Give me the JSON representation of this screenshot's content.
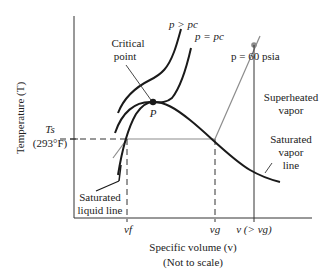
{
  "diagram": {
    "axes": {
      "y_label": "Temperature (T)",
      "x_label": "Specific volume (v)",
      "x_note": "(Not to scale)"
    },
    "labels": {
      "critical_point": [
        "Critical",
        "point"
      ],
      "point_p": "P",
      "p_gt_pc": "p > pc",
      "p_eq_pc": "p = pc",
      "p_60": "p = 60 psia",
      "superheated": [
        "Superheated",
        "vapor"
      ],
      "sat_vapor": [
        "Saturated",
        "vapor",
        "line"
      ],
      "sat_liquid": [
        "Saturated",
        "liquid line"
      ],
      "ts": "Ts",
      "ts_value": "(293°F)",
      "vf": "vf",
      "vg": "vg",
      "v_gt_vg": "v (> vg)"
    },
    "colors": {
      "curve": "#1a1a1a",
      "isobar_gray": "#8c8c8c",
      "axis": "#333333"
    }
  }
}
